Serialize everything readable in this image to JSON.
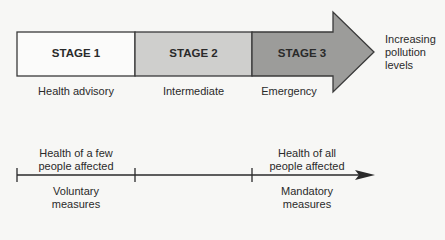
{
  "stages": [
    {
      "title": "STAGE 1",
      "label": "Health advisory",
      "fill": "#fbfbfa"
    },
    {
      "title": "STAGE 2",
      "label": "Intermediate",
      "fill": "#cfcfcd"
    },
    {
      "title": "STAGE 3",
      "label": "Emergency",
      "fill": "#9c9c9a"
    }
  ],
  "arrow_label": [
    "Increasing",
    "pollution",
    "levels"
  ],
  "timeline": {
    "top_left": [
      "Health of a few",
      "people affected"
    ],
    "top_right": [
      "Health of all",
      "people affected"
    ],
    "bottom_left": [
      "Voluntary",
      "measures"
    ],
    "bottom_right": [
      "Mandatory",
      "measures"
    ]
  },
  "colors": {
    "outline": "#3a3a3a",
    "background": "#f7f7f5"
  }
}
